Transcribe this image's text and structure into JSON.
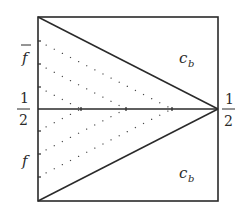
{
  "diagram": {
    "type": "unit-square-phase-diagram",
    "colors": {
      "stroke": "#2a2a2a",
      "dots": "#4a4a4a",
      "background": "#ffffff"
    },
    "box": {
      "x0": 38,
      "y0": 17,
      "x1": 218,
      "y1": 201
    },
    "middle_line_y": 109,
    "apex": {
      "x": 218,
      "y": 109
    },
    "left_labels": {
      "f_bar": "f",
      "half_num": "1",
      "half_den": "2",
      "f": "f"
    },
    "right_labels": {
      "half_num": "1",
      "half_den": "2"
    },
    "region_labels": {
      "top": {
        "base": "c",
        "sub": "b"
      },
      "bottom": {
        "base": "c",
        "sub": "b"
      }
    },
    "dotted_lines": {
      "top_start_y": [
        41,
        64,
        87
      ],
      "bottom_start_y": [
        131,
        154,
        177
      ],
      "description": "dotted lines parallel to the main diagonals, from left-edge ticks to the middle line"
    }
  }
}
